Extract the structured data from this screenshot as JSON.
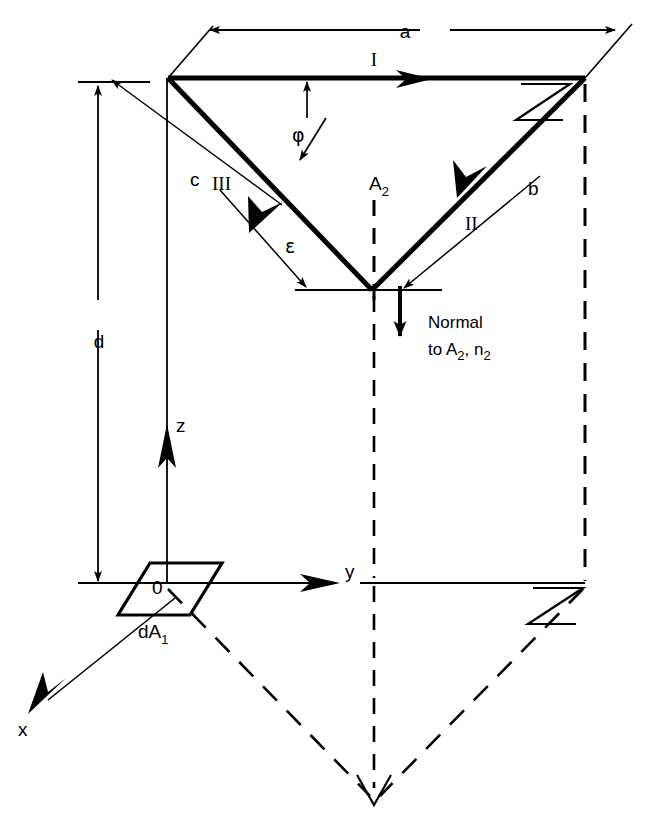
{
  "figure": {
    "kind": "engineering-line-diagram",
    "title_visible": false,
    "background_color": "#ffffff",
    "ink_color": "#000000"
  },
  "labels": {
    "dimension_a": "a",
    "dimension_b": "b",
    "dimension_c": "c",
    "dimension_d": "d",
    "side_I": "I",
    "side_II": "II",
    "side_III": "III",
    "area_A2": "A",
    "area_A2_sub": "2",
    "angle_phi": "φ",
    "angle_epsilon": "ε",
    "normal_line1": "Normal",
    "normal_line2_prefix": "to A",
    "normal_line2_sub1": "2",
    "normal_line2_mid": ", n",
    "normal_line2_sub2": "2",
    "axis_x": "x",
    "axis_y": "y",
    "axis_z": "z",
    "origin": "0",
    "element_dA1": "dA",
    "element_dA1_sub": "1"
  },
  "geometry": {
    "triangle_A2": {
      "vertex_left": [
        168,
        78
      ],
      "vertex_right": [
        585,
        78
      ],
      "vertex_bottom": [
        372,
        290
      ],
      "stroke_width": 5
    },
    "projected_triangle": {
      "vertex_left": [
        168,
        583
      ],
      "vertex_right": [
        585,
        583
      ],
      "vertex_bottom": [
        374,
        800
      ],
      "style": "dashed"
    },
    "origin_point": [
      167,
      583
    ],
    "xy_plane_line": {
      "from": [
        78,
        583
      ],
      "to": [
        585,
        583
      ]
    },
    "z_axis": {
      "from": [
        167,
        583
      ],
      "to": [
        167,
        78
      ],
      "arrow_at": [
        167,
        430
      ]
    },
    "y_axis_arrow_at": [
      345,
      583
    ],
    "x_axis": {
      "from": [
        167,
        600
      ],
      "to": [
        30,
        710
      ]
    },
    "normal_vector": {
      "from": [
        400,
        288
      ],
      "to": [
        400,
        348
      ]
    },
    "dimension_a_line": {
      "y": 30,
      "from_x": 210,
      "to_x": 615
    },
    "dimension_d_line": {
      "x": 98,
      "from_y": 82,
      "to_y": 583
    },
    "horizontal_ref_at_bottom_vertex": {
      "y": 290,
      "from_x": 295,
      "to_x": 440
    }
  }
}
